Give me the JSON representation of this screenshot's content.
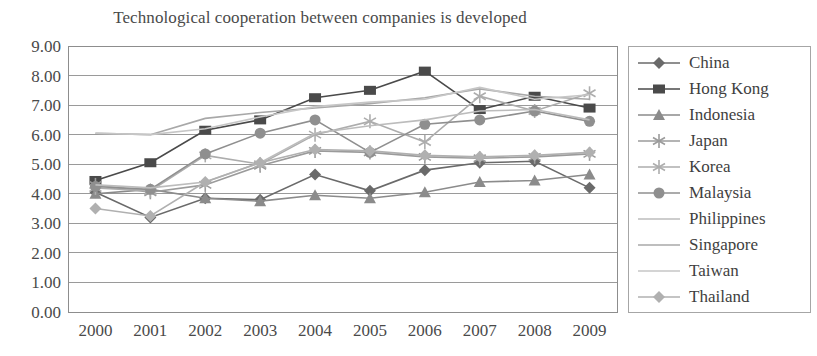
{
  "chart_data": {
    "type": "line",
    "title": "Technological cooperation between companies is developed",
    "xlabel": "",
    "ylabel": "",
    "categories": [
      "2000",
      "2001",
      "2002",
      "2003",
      "2004",
      "2005",
      "2006",
      "2007",
      "2008",
      "2009"
    ],
    "ylim": [
      0,
      9
    ],
    "ytick_labels": [
      "0.00",
      "1.00",
      "2.00",
      "3.00",
      "4.00",
      "5.00",
      "6.00",
      "7.00",
      "8.00",
      "9.00"
    ],
    "ytick_step": 1,
    "grid": true,
    "legend_position": "right",
    "series": [
      {
        "name": "China",
        "color": "#6a6a6a",
        "marker": "diamond",
        "values": [
          4.05,
          3.2,
          3.85,
          3.8,
          4.65,
          4.1,
          4.8,
          5.05,
          5.1,
          4.2
        ]
      },
      {
        "name": "Hong Kong",
        "color": "#4a4a4a",
        "marker": "square",
        "values": [
          4.45,
          5.05,
          6.15,
          6.5,
          7.25,
          7.5,
          8.15,
          6.85,
          7.3,
          6.9
        ]
      },
      {
        "name": "Indonesia",
        "color": "#8b8b8b",
        "marker": "triangle",
        "values": [
          4.0,
          4.15,
          3.85,
          3.75,
          3.95,
          3.85,
          4.05,
          4.4,
          4.45,
          4.65
        ]
      },
      {
        "name": "Japan",
        "color": "#9b9b9b",
        "marker": "star",
        "values": [
          4.3,
          4.05,
          4.3,
          4.95,
          5.45,
          5.4,
          5.25,
          5.2,
          5.25,
          5.35
        ]
      },
      {
        "name": "Korea",
        "color": "#adadad",
        "marker": "asterisk",
        "values": [
          4.2,
          4.1,
          5.3,
          5.0,
          6.0,
          6.45,
          5.75,
          7.3,
          6.8,
          7.4
        ]
      },
      {
        "name": "Malaysia",
        "color": "#8f8f8f",
        "marker": "circle",
        "values": [
          4.25,
          4.15,
          5.35,
          6.05,
          6.5,
          5.4,
          6.35,
          6.5,
          6.8,
          6.45
        ]
      },
      {
        "name": "Philippines",
        "color": "#bcbcbc",
        "marker": "none",
        "values": [
          4.3,
          4.2,
          4.4,
          5.05,
          6.05,
          6.3,
          6.5,
          6.8,
          6.85,
          6.5
        ]
      },
      {
        "name": "Singapore",
        "color": "#a8a8a8",
        "marker": "none",
        "values": [
          6.05,
          6.0,
          6.55,
          6.75,
          6.9,
          7.05,
          7.25,
          7.55,
          7.3,
          7.2
        ]
      },
      {
        "name": "Taiwan",
        "color": "#c6c6c6",
        "marker": "none",
        "values": [
          6.05,
          6.0,
          6.2,
          6.6,
          6.95,
          7.1,
          7.2,
          7.6,
          7.2,
          7.35
        ]
      },
      {
        "name": "Thailand",
        "color": "#b0b0b0",
        "marker": "diamond",
        "values": [
          3.5,
          3.25,
          4.4,
          5.05,
          5.5,
          5.45,
          5.3,
          5.25,
          5.3,
          5.4
        ]
      }
    ]
  },
  "axis": {
    "plot_left": 68,
    "plot_right": 617,
    "plot_top": 46,
    "plot_bottom": 312
  }
}
